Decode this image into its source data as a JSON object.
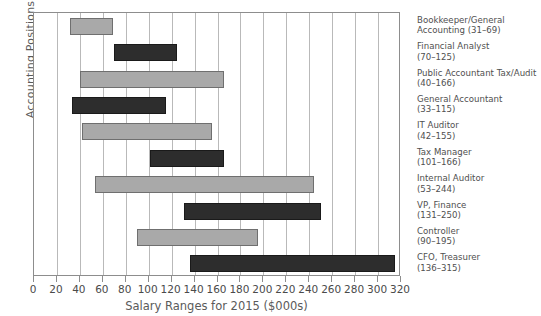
{
  "chart_data": {
    "type": "bar",
    "orientation": "horizontal",
    "subtype": "floating-range-bar",
    "title": "",
    "xlabel": "Salary Ranges for 2015 ($000s)",
    "ylabel": "Accounting Positions",
    "xlim": [
      0,
      320
    ],
    "xticks": [
      0,
      20,
      40,
      60,
      80,
      100,
      120,
      140,
      160,
      180,
      200,
      220,
      240,
      260,
      280,
      300,
      320
    ],
    "grid": true,
    "legend": "none",
    "colors": {
      "light_bar": "#a9a9a9",
      "dark_bar": "#2d2d2d",
      "grid": "#b9b9b9",
      "frame": "#8d8d8d",
      "text": "#4f4f4f"
    },
    "categories": [
      "Bookkeeper/General Accounting",
      "Financial Analyst",
      "Public Accountant Tax/Audit",
      "General Accountant",
      "IT Auditor",
      "Tax Manager",
      "Internal Auditor",
      "VP, Finance",
      "Controller",
      "CFO, Treasurer"
    ],
    "bars": [
      {
        "name": "Bookkeeper/General Accounting",
        "label_line1": "Bookkeeper/General",
        "label_line2": "Accounting (31–69)",
        "low": 31,
        "high": 69,
        "shade": "light"
      },
      {
        "name": "Financial Analyst",
        "label_line1": "Financial Analyst",
        "label_line2": "(70–125)",
        "low": 70,
        "high": 125,
        "shade": "dark"
      },
      {
        "name": "Public Accountant Tax/Audit",
        "label_line1": "Public Accountant Tax/Audit",
        "label_line2": "(40–166)",
        "low": 40,
        "high": 166,
        "shade": "light"
      },
      {
        "name": "General Accountant",
        "label_line1": "General Accountant",
        "label_line2": "(33–115)",
        "low": 33,
        "high": 115,
        "shade": "dark"
      },
      {
        "name": "IT Auditor",
        "label_line1": "IT Auditor",
        "label_line2": "(42–155)",
        "low": 42,
        "high": 155,
        "shade": "light"
      },
      {
        "name": "Tax Manager",
        "label_line1": "Tax Manager",
        "label_line2": "(101–166)",
        "low": 101,
        "high": 166,
        "shade": "dark"
      },
      {
        "name": "Internal Auditor",
        "label_line1": "Internal Auditor",
        "label_line2": "(53–244)",
        "low": 53,
        "high": 244,
        "shade": "light"
      },
      {
        "name": "VP, Finance",
        "label_line1": "VP, Finance",
        "label_line2": "(131–250)",
        "low": 131,
        "high": 250,
        "shade": "dark"
      },
      {
        "name": "Controller",
        "label_line1": "Controller",
        "label_line2": "(90–195)",
        "low": 90,
        "high": 195,
        "shade": "light"
      },
      {
        "name": "CFO, Treasurer",
        "label_line1": "CFO, Treasurer",
        "label_line2": "(136–315)",
        "low": 136,
        "high": 315,
        "shade": "dark"
      }
    ]
  }
}
